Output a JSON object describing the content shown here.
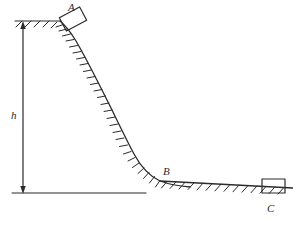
{
  "figure": {
    "type": "physics-diagram",
    "background_color": "#ffffff",
    "stroke_color": "#2b2b2b",
    "labels": {
      "block_a": "A",
      "point_b": "B",
      "block_c": "C",
      "height": "h"
    },
    "elements": {
      "block_a_name": "block A on top of incline",
      "block_c_name": "block C on ground",
      "point_b_name": "point B at bottom of incline",
      "height_arrow_name": "height dimension arrow h",
      "incline_name": "curved hatched incline surface",
      "ground_name": "hatched horizontal ground",
      "top_ledge_name": "hatched top ledge",
      "baseline_name": "horizontal reference baseline"
    }
  },
  "geometry": {
    "top_ledge": {
      "x1": 15,
      "y1": 21,
      "x2": 60,
      "y2": 21
    },
    "baseline": {
      "x1": 12,
      "y1": 193,
      "x2": 146,
      "y2": 193
    },
    "height_arrow": {
      "x": 23,
      "y_top": 24,
      "y_bottom": 192
    },
    "curve_path": "M 60 21 C 66 26, 70 31, 76 41 C 86 58, 96 78, 108 102 C 118 122, 126 139, 134 154 C 141 167, 149 176, 160 181 C 168 184, 178 186, 190 187",
    "ground_path": "M 160 181 L 293 188",
    "block_a": {
      "x": 62,
      "y": 12,
      "w": 22,
      "h": 14,
      "rotation": -28
    },
    "block_c": {
      "x": 262,
      "y": 179,
      "w": 23,
      "h": 14
    }
  }
}
